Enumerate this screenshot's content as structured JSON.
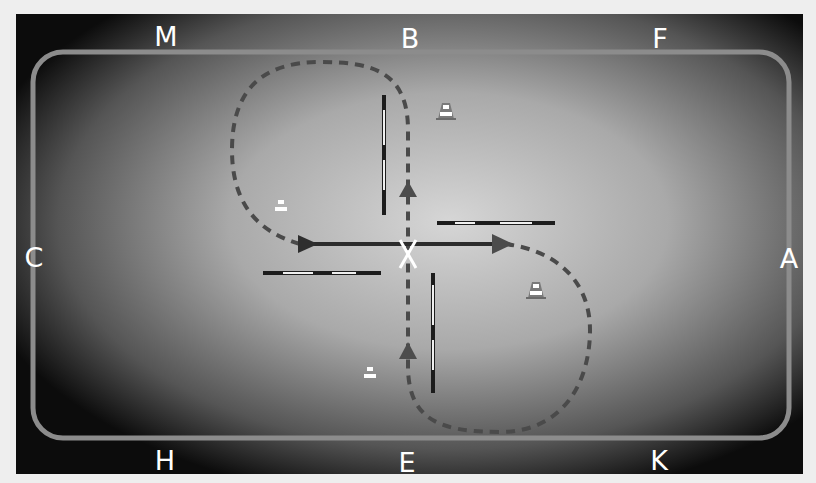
{
  "diagram": {
    "type": "dressage-arena-exercise",
    "arena": {
      "background_outer": "#eeeeee",
      "gradient_center": "#d4d4d4",
      "gradient_mid": "#9a9a9a",
      "gradient_edge": "#0c0c0c",
      "track_color": "#8c8c8c"
    },
    "markers": [
      {
        "letter": "M",
        "x": 166,
        "y": 36
      },
      {
        "letter": "B",
        "x": 410,
        "y": 38
      },
      {
        "letter": "F",
        "x": 660,
        "y": 38
      },
      {
        "letter": "C",
        "x": 34,
        "y": 257
      },
      {
        "letter": "A",
        "x": 789,
        "y": 258
      },
      {
        "letter": "H",
        "x": 165,
        "y": 460
      },
      {
        "letter": "E",
        "x": 407,
        "y": 462
      },
      {
        "letter": "K",
        "x": 659,
        "y": 460
      }
    ],
    "center_marker": {
      "label": "X",
      "x": 408,
      "y": 255
    },
    "path": {
      "solid_line_color": "#2c2c2c",
      "dashed_line_color": "#4a4a4a",
      "arrow_color": "#4c4c4c",
      "description": "Figure-eight: two loops crossing at X, solid line across the centre line C–A"
    },
    "poles": [
      {
        "orientation": "vertical",
        "x": 384,
        "y1": 95,
        "y2": 215
      },
      {
        "orientation": "horizontal",
        "y": 223,
        "x1": 437,
        "x2": 555
      },
      {
        "orientation": "horizontal",
        "y": 273,
        "x1": 263,
        "x2": 381
      },
      {
        "orientation": "vertical",
        "x": 433,
        "y1": 273,
        "y2": 393
      }
    ],
    "cones": [
      {
        "x": 446,
        "y": 113
      },
      {
        "x": 281,
        "y": 208
      },
      {
        "x": 536,
        "y": 292
      },
      {
        "x": 370,
        "y": 375
      }
    ]
  }
}
